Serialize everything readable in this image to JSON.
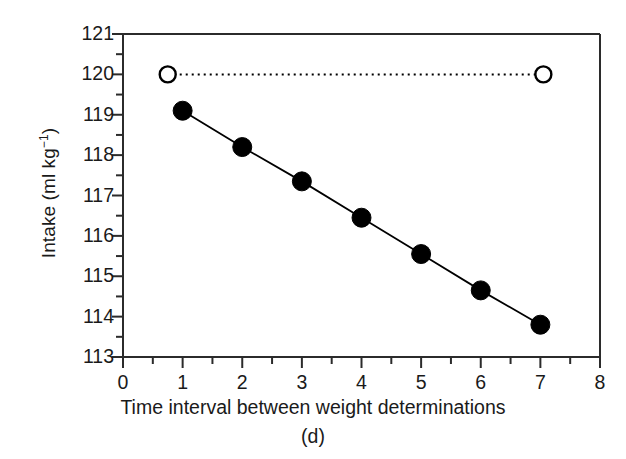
{
  "chart_data": {
    "type": "line",
    "title": "",
    "subtitle": "",
    "panel_label": "(d)",
    "xlabel": "Time interval between weight determinations",
    "xunit": "(d)",
    "ylabel": "Intake (ml kg−1)",
    "ylabel_main": "Intake (ml kg",
    "ylabel_exp": "−1",
    "ylabel_tail": ")",
    "xlim": [
      0,
      8
    ],
    "ylim": [
      113,
      121
    ],
    "grid": false,
    "legend": "none",
    "x_major_step": 1,
    "x_minor_step": 0.5,
    "y_major_step": 1,
    "y_minor_step": 0.5,
    "xticks": [
      "0",
      "1",
      "2",
      "3",
      "4",
      "5",
      "6",
      "7",
      "8"
    ],
    "xtick_values": [
      0,
      1,
      2,
      3,
      4,
      5,
      6,
      7,
      8
    ],
    "yticks": [
      "113",
      "114",
      "115",
      "116",
      "117",
      "118",
      "119",
      "120",
      "121"
    ],
    "ytick_values": [
      113,
      114,
      115,
      116,
      117,
      118,
      119,
      120,
      121
    ],
    "series": [
      {
        "name": "measured-intake",
        "marker": "filled-circle",
        "linestyle": "solid",
        "color": "#000000",
        "x": [
          1,
          2,
          3,
          4,
          5,
          6,
          7
        ],
        "values": [
          119.1,
          118.2,
          117.35,
          116.45,
          115.55,
          114.65,
          113.8
        ]
      },
      {
        "name": "reference-intake",
        "marker": "open-circle",
        "linestyle": "dotted",
        "color": "#000000",
        "x": [
          0.75,
          7.05
        ],
        "values": [
          120.0,
          120.0
        ]
      }
    ]
  },
  "style": {
    "axis_color": "#2b2b2b",
    "text_color": "#1a1a1a",
    "background": "#ffffff"
  }
}
